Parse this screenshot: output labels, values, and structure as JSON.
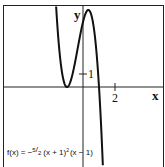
{
  "chart_data": {
    "type": "line",
    "title": "",
    "xlabel": "x",
    "ylabel": "y",
    "xlim": [
      -5,
      5
    ],
    "ylim": [
      -6,
      3
    ],
    "grid": false,
    "function": "-5/2*(x+1)^2*(x-1)",
    "annotation": {
      "prefix": "f(x) = −",
      "frac_num": "5",
      "frac_den": "2",
      "suffix": "(x + 1)",
      "sup": "2",
      "tail": "(x − 1)"
    },
    "x_ticks": [
      {
        "value": 2,
        "label": "2"
      }
    ],
    "y_ticks": [
      {
        "value": 1,
        "label": "1"
      }
    ],
    "key_points": [
      {
        "name": "local-min",
        "x": -1,
        "y": 0
      },
      {
        "name": "local-max",
        "x": -0.333,
        "y": 1.48
      },
      {
        "name": "x-intercept",
        "x": 1,
        "y": 0
      },
      {
        "name": "y-intercept",
        "x": 0,
        "y": 2.5
      }
    ],
    "series": [
      {
        "name": "f(x)",
        "color": "#111111"
      }
    ]
  }
}
